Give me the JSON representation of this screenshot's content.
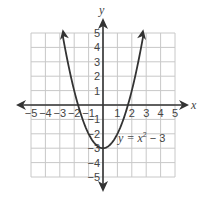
{
  "chart_data": {
    "type": "line",
    "title": "",
    "xlabel": "x",
    "ylabel": "y",
    "xlim": [
      -5,
      5
    ],
    "ylim": [
      -5,
      5
    ],
    "grid": true,
    "x_ticks": [
      -5,
      -4,
      -3,
      -2,
      -1,
      1,
      2,
      3,
      4,
      5
    ],
    "y_ticks": [
      5,
      4,
      3,
      2,
      1,
      -1,
      -2,
      -3,
      -4,
      -5
    ],
    "x_tick_labels": [
      "−5",
      "−4",
      "−3",
      "−2",
      "−1",
      "1",
      "2",
      "3",
      "4",
      "5"
    ],
    "y_tick_labels": [
      "5",
      "4",
      "3",
      "2",
      "1",
      "−1",
      "−2",
      "−3",
      "−4",
      "−5"
    ],
    "series": [
      {
        "name": "y = x^2 - 3",
        "function": "x^2 - 3",
        "x_domain": [
          -2.8,
          2.8
        ],
        "vertex": [
          0,
          -3
        ],
        "x_intercepts": [
          -1.732,
          1.732
        ],
        "arrows_at_ends": true,
        "color": "#333333"
      }
    ],
    "annotation": {
      "prefix": "y = x",
      "exponent": "2",
      "suffix": " − 3",
      "anchor": [
        1.05,
        -2.6
      ]
    }
  }
}
